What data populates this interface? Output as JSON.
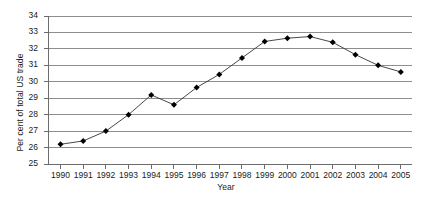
{
  "chart_data": {
    "type": "line",
    "title": "",
    "xlabel": "Year",
    "ylabel": "Per cent of total US trade",
    "categories": [
      "1990",
      "1991",
      "1992",
      "1993",
      "1994",
      "1995",
      "1996",
      "1997",
      "1998",
      "1999",
      "2000",
      "2001",
      "2002",
      "2003",
      "2004",
      "2005"
    ],
    "x": [
      1990,
      1991,
      1992,
      1993,
      1994,
      1995,
      1996,
      1997,
      1998,
      1999,
      2000,
      2001,
      2002,
      2003,
      2004,
      2005
    ],
    "values": [
      26.2,
      26.4,
      27.0,
      28.0,
      29.2,
      28.6,
      29.65,
      30.45,
      31.45,
      32.45,
      32.65,
      32.75,
      32.4,
      31.65,
      31.0,
      30.6
    ],
    "series": [
      {
        "name": "Per cent of total US trade",
        "values": [
          26.2,
          26.4,
          27.0,
          28.0,
          29.2,
          28.6,
          29.65,
          30.45,
          31.45,
          32.45,
          32.65,
          32.75,
          32.4,
          31.65,
          31.0,
          30.6
        ],
        "marker": "diamond",
        "color": "#000000"
      }
    ],
    "ylim": [
      25,
      34
    ],
    "yticks": [
      25,
      26,
      27,
      28,
      29,
      30,
      31,
      32,
      33,
      34
    ],
    "ytick_labels": [
      "25",
      "26",
      "27",
      "28",
      "29",
      "30",
      "31",
      "32",
      "33",
      "34"
    ],
    "xtick_labels": [
      "1990",
      "1991",
      "1992",
      "1993",
      "1994",
      "1995",
      "1996",
      "1997",
      "1998",
      "1999",
      "2000",
      "2001",
      "2002",
      "2003",
      "2004",
      "2005"
    ],
    "grid": true,
    "grid_axis": "y",
    "legend": false,
    "legend_position": "none",
    "line_color": "#333333",
    "marker_color": "#000000",
    "grid_color": "#8d8d8d",
    "axis_color": "#6b6b6b",
    "background": "#ffffff"
  }
}
